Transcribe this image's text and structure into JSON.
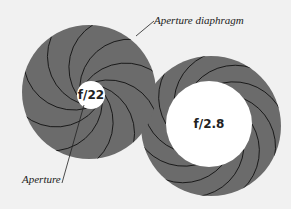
{
  "labels": {
    "diaphragm": "Aperture diaphragm",
    "aperture": "Aperture",
    "small_stop": "f/22",
    "large_stop": "f/2.8"
  },
  "colors": {
    "background": "#f1f1f1",
    "blade_fill": "#6b6b6b",
    "blade_line": "#111111",
    "opening": "#ffffff"
  }
}
